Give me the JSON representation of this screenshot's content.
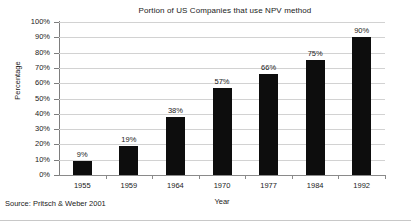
{
  "chart_data": {
    "type": "bar",
    "title": "Portion of US Companies that use NPV method",
    "xlabel": "Year",
    "ylabel": "Percentage",
    "categories": [
      "1955",
      "1959",
      "1964",
      "1970",
      "1977",
      "1984",
      "1992"
    ],
    "values": [
      9,
      19,
      38,
      57,
      66,
      75,
      90
    ],
    "data_labels": [
      "9%",
      "19%",
      "38%",
      "57%",
      "66%",
      "75%",
      "90%"
    ],
    "ylim": [
      0,
      100
    ],
    "ytick_values": [
      0,
      10,
      20,
      30,
      40,
      50,
      60,
      70,
      80,
      90,
      100
    ],
    "ytick_labels": [
      "0%",
      "10%",
      "20%",
      "30%",
      "40%",
      "50%",
      "60%",
      "70%",
      "80%",
      "90%",
      "100%"
    ],
    "grid": true,
    "legend": false,
    "bar_color": "#0d0d0d",
    "grid_color": "#d2d2d2",
    "axis_color": "#7d7d7d",
    "background": "#ffffff"
  },
  "source_note": "Source: Pritsch & Weber 2001"
}
